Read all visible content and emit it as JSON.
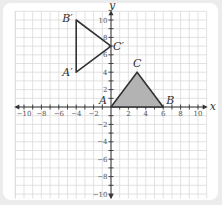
{
  "diagram": {
    "type": "coordinate-plane-transformation",
    "axes": {
      "x_label": "x",
      "y_label": "y",
      "x_range": [
        -11,
        11
      ],
      "y_range": [
        -10.5,
        11
      ],
      "x_tick_labels": [
        "−10",
        "−8",
        "−6",
        "−4",
        "−2",
        "2",
        "4",
        "6",
        "8",
        "10"
      ],
      "y_tick_labels": [
        "10",
        "8",
        "6",
        "4",
        "2",
        "−2",
        "−4",
        "−6",
        "−8",
        "−10"
      ],
      "grid": true
    },
    "original_triangle": {
      "name": "ABC",
      "fill": "#b3b3b3",
      "vertices": [
        {
          "label": "A",
          "x": 0,
          "y": 0
        },
        {
          "label": "B",
          "x": 6,
          "y": 0
        },
        {
          "label": "C",
          "x": 3,
          "y": 4
        }
      ]
    },
    "image_triangle": {
      "name": "A'B'C'",
      "fill": "none",
      "vertices": [
        {
          "label": "A′",
          "x": -4,
          "y": 4
        },
        {
          "label": "B′",
          "x": -4,
          "y": 10
        },
        {
          "label": "C′",
          "x": 0,
          "y": 7
        }
      ]
    },
    "colors": {
      "background": "#ececec",
      "card": "#ffffff",
      "grid": "#d9d9d9",
      "axis": "#333333",
      "stroke": "#333333"
    }
  }
}
